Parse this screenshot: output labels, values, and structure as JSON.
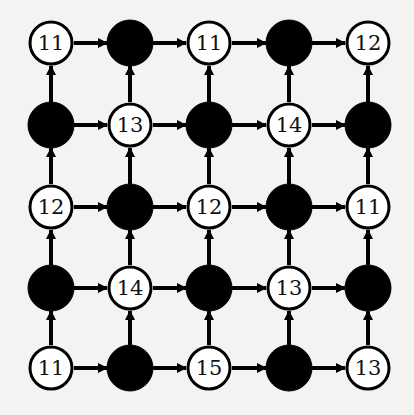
{
  "diagram": {
    "type": "directed-grid-graph",
    "rows": 5,
    "cols": 5,
    "edge_direction": {
      "horizontal": "left-to-right",
      "vertical": "bottom-to-top"
    },
    "colors": {
      "filled_node": "#000000",
      "open_node_fill": "#ffffff",
      "stroke": "#000000",
      "background": "#f3f3f2"
    },
    "nodes": [
      [
        {
          "filled": false,
          "label": "11"
        },
        {
          "filled": true,
          "label": ""
        },
        {
          "filled": false,
          "label": "11"
        },
        {
          "filled": true,
          "label": ""
        },
        {
          "filled": false,
          "label": "12"
        }
      ],
      [
        {
          "filled": true,
          "label": ""
        },
        {
          "filled": false,
          "label": "13"
        },
        {
          "filled": true,
          "label": ""
        },
        {
          "filled": false,
          "label": "14"
        },
        {
          "filled": true,
          "label": ""
        }
      ],
      [
        {
          "filled": false,
          "label": "12"
        },
        {
          "filled": true,
          "label": ""
        },
        {
          "filled": false,
          "label": "12"
        },
        {
          "filled": true,
          "label": ""
        },
        {
          "filled": false,
          "label": "11"
        }
      ],
      [
        {
          "filled": true,
          "label": ""
        },
        {
          "filled": false,
          "label": "14"
        },
        {
          "filled": true,
          "label": ""
        },
        {
          "filled": false,
          "label": "13"
        },
        {
          "filled": true,
          "label": ""
        }
      ],
      [
        {
          "filled": false,
          "label": "11"
        },
        {
          "filled": true,
          "label": ""
        },
        {
          "filled": false,
          "label": "15"
        },
        {
          "filled": true,
          "label": ""
        },
        {
          "filled": false,
          "label": "13"
        }
      ]
    ]
  }
}
